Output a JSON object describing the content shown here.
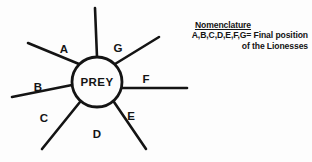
{
  "figure": {
    "center_node": {
      "label": "PREY",
      "shape": "circle"
    },
    "spokes": [
      {
        "id": "top",
        "label": "",
        "angle_deg": 270,
        "labeled": false
      },
      {
        "id": "A",
        "label": "A",
        "angle_deg": 218
      },
      {
        "id": "B",
        "label": "B",
        "angle_deg": 187
      },
      {
        "id": "C",
        "label": "C",
        "angle_deg": 128
      },
      {
        "id": "D",
        "label": "D",
        "angle_deg": 95
      },
      {
        "id": "E",
        "label": "E",
        "angle_deg": 58
      },
      {
        "id": "F",
        "label": "F",
        "angle_deg": 4
      },
      {
        "id": "G",
        "label": "G",
        "angle_deg": 318
      }
    ],
    "legend": {
      "title": "Nomenclature",
      "line1": "A,B,C,D,E,F,G= Final position",
      "line2": "of the Lionesses"
    },
    "colors": {
      "ink": "#141414",
      "background": "#fdfdfd"
    }
  }
}
